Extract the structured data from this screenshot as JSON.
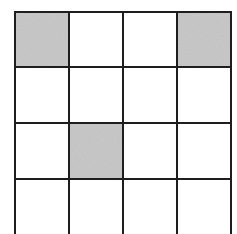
{
  "grid": {
    "rows": 4,
    "cols": 4,
    "x_lines": [
      15,
      69,
      123,
      177,
      231
    ],
    "y_lines": [
      12,
      67,
      123,
      179,
      240
    ],
    "line_color": "#1e1e1e",
    "line_width": 2,
    "cell_fill": "#ffffff",
    "shaded_fill": "#c9c9c9",
    "shaded_cells": [
      {
        "row": 0,
        "col": 0
      },
      {
        "row": 0,
        "col": 3
      },
      {
        "row": 2,
        "col": 1
      }
    ]
  }
}
